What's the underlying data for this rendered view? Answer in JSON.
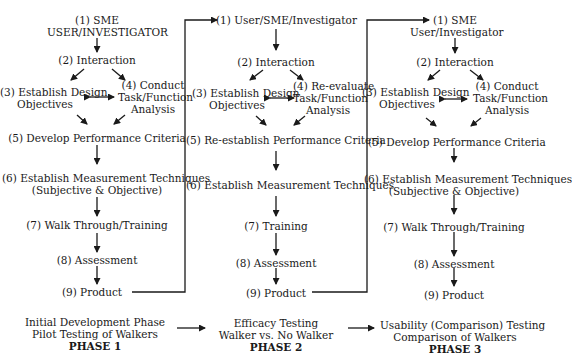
{
  "columns": [
    {
      "id": "phase1",
      "steps": {
        "s1a": "(1) SME",
        "s1b": "USER/INVESTIGATOR",
        "s2": "(2) Interaction",
        "s3a": "(3) Establish Design",
        "s3b": "Objectives",
        "s4a": "(4) Conduct",
        "s4b": "Task/Function",
        "s4c": "Analysis",
        "s5": "(5) Develop Performance Criteria",
        "s6a": "(6) Establish Measurement Techniques",
        "s6b": "(Subjective & Objective)",
        "s7": "(7) Walk Through/Training",
        "s8": "(8) Assessment",
        "s9": "(9) Product"
      },
      "footer": {
        "line1": "Initial Development Phase",
        "line2": "Pilot Testing of Walkers",
        "phase": "PHASE 1"
      }
    },
    {
      "id": "phase2",
      "steps": {
        "s1a": "(1) User/SME/Investigator",
        "s2": "(2) Interaction",
        "s3a": "(3) Establish Design",
        "s3b": "Objectives",
        "s4a": "(4) Re-evaluate",
        "s4b": "Task/Function",
        "s4c": "Analysis",
        "s5": "(5) Re-establish Performance Criteria",
        "s6a": "(6) Establish Measurement Techniques",
        "s7": "(7) Training",
        "s8": "(8) Assessment",
        "s9": "(9) Product"
      },
      "footer": {
        "line1": "Efficacy Testing",
        "line2": "Walker vs. No Walker",
        "phase": "PHASE 2"
      }
    },
    {
      "id": "phase3",
      "steps": {
        "s1a": "(1) SME",
        "s1b": "User/Investigator",
        "s2": "(2) Interaction",
        "s3a": "(3) Establish Design",
        "s3b": "Objectives",
        "s4a": "(4) Conduct",
        "s4b": "Task/Function",
        "s4c": "Analysis",
        "s5": "(5) Develop Performance Criteria",
        "s6a": "(6) Establish Measurement Techniques",
        "s6b": "(Subjective & Objective)",
        "s7": "(7) Walk Through/Training",
        "s8": "(8) Assessment",
        "s9": "(9) Product"
      },
      "footer": {
        "line1": "Usability (Comparison) Testing",
        "line2": "Comparison of Walkers",
        "phase": "PHASE 3"
      }
    }
  ],
  "colors": {
    "ink": "#1a1a1a",
    "background": "#ffffff"
  }
}
